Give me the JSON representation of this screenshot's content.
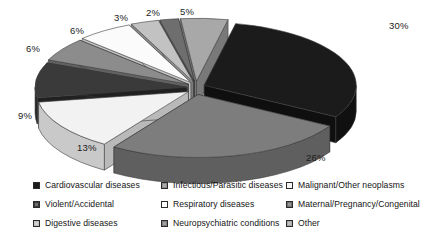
{
  "chart_data": {
    "type": "pie",
    "title": "",
    "subtitle": "",
    "xlabel": "",
    "ylabel": "",
    "style": "3d-exploded-pie",
    "legend_position": "bottom",
    "grid": false,
    "unit": "%",
    "categories": [
      "Cardiovascular diseases",
      "Neuropsychiatric conditions",
      "Infectious/Parasitic diseases",
      "Malignant/Other neoplasms",
      "Respiratory diseases",
      "Digestive diseases",
      "Violent/Accidental",
      "Maternal/Pregnancy/Congenital",
      "Other"
    ],
    "values": [
      30,
      26,
      13,
      9,
      6,
      6,
      3,
      2,
      5
    ],
    "labels": [
      "30%",
      "26%",
      "13%",
      "9%",
      "6%",
      "6%",
      "3%",
      "2%",
      "5%"
    ],
    "slices": [
      {
        "label": "30%",
        "value": 30,
        "category": "Cardiovascular diseases",
        "color": "#1b1b1b",
        "side_color": "#101010",
        "exploded": true
      },
      {
        "label": "26%",
        "value": 26,
        "category": "Neuropsychiatric conditions",
        "color": "#7d7d7d",
        "side_color": "#5f5f5f",
        "exploded": true
      },
      {
        "label": "13%",
        "value": 13,
        "category": "Malignant/Other neoplasms",
        "color": "#f2f2f2",
        "side_color": "#c9c9c9",
        "exploded": true
      },
      {
        "label": "9%",
        "value": 9,
        "category": "Violent/Accidental",
        "color": "#3a3a3a",
        "side_color": "#242424",
        "exploded": true
      },
      {
        "label": "6%",
        "value": 6,
        "category": "Infectious/Parasitic diseases",
        "color": "#8c8c8c",
        "side_color": "#6b6b6b",
        "exploded": true
      },
      {
        "label": "6%",
        "value": 6,
        "category": "Respiratory diseases",
        "color": "#fbfbfb",
        "side_color": "#d2d2d2",
        "exploded": true
      },
      {
        "label": "3%",
        "value": 3,
        "category": "Digestive diseases",
        "color": "#c2c2c2",
        "side_color": "#9b9b9b",
        "exploded": true
      },
      {
        "label": "2%",
        "value": 2,
        "category": "Maternal/Pregnancy/Congenital",
        "color": "#6e6e6e",
        "side_color": "#525252",
        "exploded": true
      },
      {
        "label": "5%",
        "value": 5,
        "category": "Other",
        "color": "#a8a8a8",
        "side_color": "#848484",
        "exploded": true
      }
    ]
  },
  "labels": {
    "l30": "30%",
    "l26": "26%",
    "l13": "13%",
    "l9": "9%",
    "l6a": "6%",
    "l6b": "6%",
    "l3": "3%",
    "l2": "2%",
    "l5": "5%"
  },
  "legend": {
    "items": [
      {
        "label": "Cardiovascular diseases",
        "color": "#1b1b1b",
        "pattern": "solid"
      },
      {
        "label": "Infectious/Parasitic diseases",
        "color": "#8c8c8c",
        "pattern": "hatch"
      },
      {
        "label": "Malignant/Other neoplasms",
        "color": "#f4f4f4",
        "pattern": "solid"
      },
      {
        "label": "Violent/Accidental",
        "color": "#3a3a3a",
        "pattern": "hatch"
      },
      {
        "label": "Respiratory diseases",
        "color": "#ffffff",
        "pattern": "solid"
      },
      {
        "label": "Maternal/Pregnancy/Congenital",
        "color": "#6e6e6e",
        "pattern": "hatch"
      },
      {
        "label": "Digestive diseases",
        "color": "#c2c2c2",
        "pattern": "hatch"
      },
      {
        "label": "Neuropsychiatric conditions",
        "color": "#7d7d7d",
        "pattern": "hatch"
      },
      {
        "label": "Other",
        "color": "#a8a8a8",
        "pattern": "hatch"
      }
    ]
  }
}
